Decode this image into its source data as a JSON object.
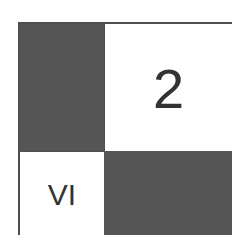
{
  "grid": {
    "cells": [
      {
        "position": "top-left",
        "fill": "dark",
        "label": ""
      },
      {
        "position": "top-right",
        "fill": "light",
        "label": "2"
      },
      {
        "position": "bottom-left",
        "fill": "light",
        "label": "VI"
      },
      {
        "position": "bottom-right",
        "fill": "dark",
        "label": ""
      }
    ]
  },
  "colors": {
    "dark": "#555555",
    "light": "#ffffff",
    "border": "#4f4f4f",
    "text": "#333333"
  }
}
